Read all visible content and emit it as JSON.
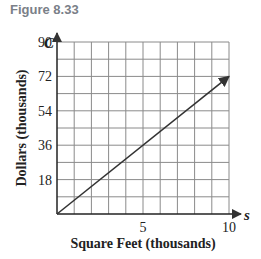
{
  "figure_label": "Figure 8.33",
  "chart_data": {
    "type": "line",
    "title": "Figure 8.33",
    "xlabel": "Square Feet (thousands)",
    "ylabel": "Dollars (thousands)",
    "x_var": "s",
    "y_var": "C",
    "xlim": [
      0,
      10
    ],
    "ylim": [
      0,
      90
    ],
    "x_ticks": [
      5,
      10
    ],
    "x_tick_labels": [
      "5",
      "10"
    ],
    "y_ticks": [
      18,
      36,
      54,
      72,
      90
    ],
    "y_tick_labels": [
      "18",
      "36",
      "54",
      "72",
      "90"
    ],
    "grid": true,
    "x_grid_step": 1,
    "y_grid_step": 9,
    "series": [
      {
        "name": "C(s)",
        "x": [
          0,
          10
        ],
        "y": [
          0,
          72
        ],
        "arrow_end": true,
        "color": "#333333"
      }
    ],
    "legend": null
  }
}
